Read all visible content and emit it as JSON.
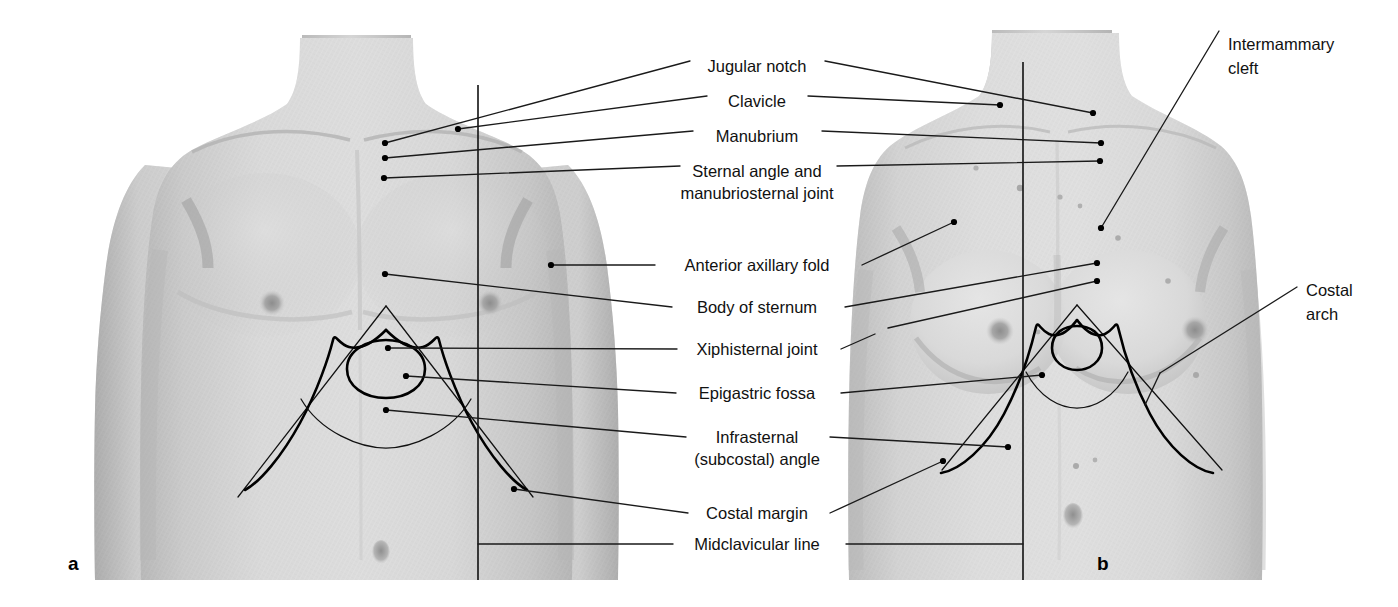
{
  "figure": {
    "panels": [
      {
        "id": "a",
        "letter": "a",
        "subject": "male anterior thorax"
      },
      {
        "id": "b",
        "letter": "b",
        "subject": "female anterior thorax"
      }
    ],
    "background_color": "#ffffff",
    "skin_color": "#d6d6d6",
    "line_color": "#111111"
  },
  "center_labels": [
    {
      "id": "jugular-notch",
      "lines": [
        "Jugular notch"
      ],
      "x": 757,
      "y": 66,
      "anchor": "middle"
    },
    {
      "id": "clavicle",
      "lines": [
        "Clavicle"
      ],
      "x": 757,
      "y": 101,
      "anchor": "middle"
    },
    {
      "id": "manubrium",
      "lines": [
        "Manubrium"
      ],
      "x": 757,
      "y": 136,
      "anchor": "middle"
    },
    {
      "id": "sternal-angle",
      "lines": [
        "Sternal angle and",
        "manubriosternal joint"
      ],
      "x": 757,
      "y": 171,
      "anchor": "middle"
    },
    {
      "id": "anterior-axillary-fold",
      "lines": [
        "Anterior axillary fold"
      ],
      "x": 757,
      "y": 270,
      "anchor": "middle"
    },
    {
      "id": "body-of-sternum",
      "lines": [
        "Body of sternum"
      ],
      "x": 757,
      "y": 312,
      "anchor": "middle"
    },
    {
      "id": "xiphisternal-joint",
      "lines": [
        "Xiphisternal joint"
      ],
      "x": 757,
      "y": 354,
      "anchor": "middle"
    },
    {
      "id": "epigastric-fossa",
      "lines": [
        "Epigastric fossa"
      ],
      "x": 757,
      "y": 398,
      "anchor": "middle"
    },
    {
      "id": "infrasternal-angle",
      "lines": [
        "Infrasternal",
        "(subcostal) angle"
      ],
      "x": 757,
      "y": 442,
      "anchor": "middle"
    },
    {
      "id": "costal-margin",
      "lines": [
        "Costal margin"
      ],
      "x": 757,
      "y": 518,
      "anchor": "middle"
    },
    {
      "id": "midclavicular-line",
      "lines": [
        "Midclavicular line"
      ],
      "x": 757,
      "y": 548,
      "anchor": "middle"
    }
  ],
  "right_labels": [
    {
      "id": "intermammary-cleft",
      "lines": [
        "Intermammary",
        "cleft"
      ],
      "x": 1228,
      "y": 50,
      "anchor": "start"
    },
    {
      "id": "costal-arch",
      "lines": [
        "Costal",
        "arch"
      ],
      "x": 1306,
      "y": 296,
      "anchor": "start"
    }
  ],
  "panel_letters": [
    {
      "id": "panel-a-letter",
      "text": "a",
      "x": 68,
      "y": 570
    },
    {
      "id": "panel-b-letter",
      "text": "b",
      "x": 1097,
      "y": 570
    }
  ],
  "annotation_targets": {
    "panel_a": {
      "jugular_notch": [
        385,
        143
      ],
      "clavicle": [
        458,
        129
      ],
      "manubrium": [
        385,
        158
      ],
      "sternal_angle": [
        384,
        178
      ],
      "anterior_axillary_fold": [
        551,
        265
      ],
      "body_of_sternum": [
        385,
        274
      ],
      "xiphisternal_joint": [
        388,
        348
      ],
      "epigastric_fossa": [
        406,
        376
      ],
      "infrasternal_angle": [
        386,
        410
      ],
      "costal_margin": [
        514,
        489
      ],
      "midclavicular_line_x": 478
    },
    "panel_b": {
      "jugular_notch": [
        1093,
        113
      ],
      "clavicle": [
        1000,
        105
      ],
      "manubrium": [
        1101,
        143
      ],
      "sternal_angle": [
        1100,
        161
      ],
      "anterior_axillary_fold": [
        954,
        222
      ],
      "body_of_sternum": [
        1097,
        263
      ],
      "xiphisternal_joint": [
        1097,
        281
      ],
      "epigastric_fossa": [
        1042,
        375
      ],
      "infrasternal_angle": [
        1008,
        447
      ],
      "costal_margin": [
        943,
        461
      ],
      "intermammary_cleft": [
        1101,
        228
      ],
      "costal_arch": [
        1160,
        373
      ],
      "midclavicular_line_x": 1023
    }
  }
}
